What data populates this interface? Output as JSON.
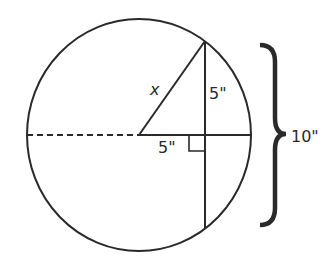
{
  "diagram": {
    "type": "circle-chord-geometry",
    "labels": {
      "hypotenuse": "x",
      "half_chord": "5\"",
      "center_to_chord": "5\"",
      "chord_length": "10\""
    },
    "colors": {
      "stroke": "#2a2a2a",
      "background": "#ffffff"
    }
  }
}
